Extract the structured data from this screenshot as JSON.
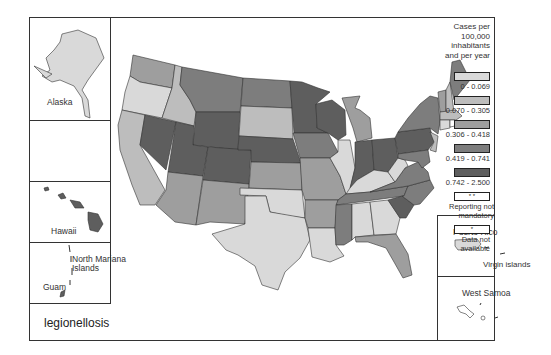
{
  "map": {
    "title": "legionellosis",
    "insets": {
      "alaska": "Alaska",
      "hawaii": "Hawaii",
      "north_mariana": "North Mariana Islands",
      "north_mariana_line1": "North Mariana",
      "north_mariana_line2": "Islands",
      "guam": "Guam",
      "puerto_rico": "Puerto Rico",
      "virgin_islands": "Virgin islands",
      "west_samoa": "West Samoa"
    }
  },
  "legend": {
    "heading_line1": "Cases per",
    "heading_line2": "100,000 inhabitants",
    "heading_line3": "and per year",
    "items": [
      {
        "label": "0 - 0.069",
        "color": "#d9d9d9",
        "marker": ""
      },
      {
        "label": "0.070 - 0.305",
        "color": "#bdbdbd",
        "marker": ""
      },
      {
        "label": "0.306 - 0.418",
        "color": "#9e9e9e",
        "marker": ""
      },
      {
        "label": "0.419 - 0.741",
        "color": "#7d7d7d",
        "marker": ""
      },
      {
        "label": "0.742 - 2.500",
        "color": "#5e5e5e",
        "marker": ""
      },
      {
        "label": "Reporting not mandatory",
        "color": "#ffffff",
        "marker": "* *"
      },
      {
        "label": "Data not available",
        "color": "#ffffff",
        "marker": "*"
      }
    ]
  },
  "colors": {
    "c1": "#d9d9d9",
    "c2": "#bdbdbd",
    "c3": "#9e9e9e",
    "c4": "#7d7d7d",
    "c5": "#5e5e5e",
    "border": "#333333"
  }
}
